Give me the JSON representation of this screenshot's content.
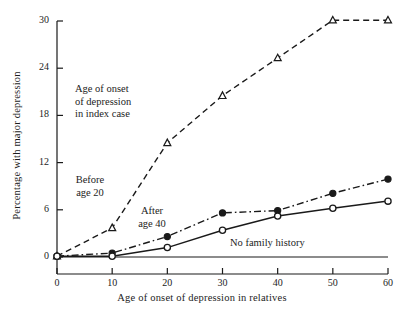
{
  "figure": {
    "background": "#ffffff",
    "ink": "#1a1a1a"
  },
  "chart_data": {
    "type": "line",
    "title": "",
    "xlabel": "Age of onset of depression in relatives",
    "ylabel": "Percentage with major depression",
    "xlim": [
      0,
      60
    ],
    "ylim": [
      0,
      30
    ],
    "xticks": [
      0,
      10,
      20,
      30,
      40,
      50,
      60
    ],
    "yticks": [
      0,
      6,
      12,
      18,
      24,
      30
    ],
    "xtick_labels": [
      "0",
      "10",
      "20",
      "30",
      "40",
      "50",
      "60"
    ],
    "ytick_labels": [
      "0",
      "6",
      "12",
      "18",
      "24",
      "30"
    ],
    "grid": false,
    "legend": "inline-annotations",
    "x": [
      0,
      10,
      20,
      30,
      40,
      50,
      60
    ],
    "series": [
      {
        "name": "Before age 20",
        "values": [
          0.1,
          3.7,
          14.5,
          20.5,
          25.3,
          30.1,
          30.1
        ],
        "linestyle": "dashed",
        "marker": "open-triangle",
        "color": "#1a1a1a"
      },
      {
        "name": "After age 40",
        "values": [
          0.1,
          0.5,
          2.6,
          5.6,
          5.9,
          8.1,
          9.9
        ],
        "linestyle": "dash-dot",
        "marker": "filled-circle",
        "color": "#1a1a1a"
      },
      {
        "name": "No family history",
        "values": [
          0.1,
          0.1,
          1.2,
          3.4,
          5.2,
          6.2,
          7.1
        ],
        "linestyle": "solid",
        "marker": "open-circle",
        "color": "#1a1a1a"
      }
    ],
    "annotations": [
      {
        "id": "index-case-note",
        "text": "Age of onset\nof depression\nin index case",
        "x_px": 75,
        "y_px": 83,
        "align": "left"
      },
      {
        "id": "before-age-20-label",
        "text": "Before\nage 20",
        "x_px": 90,
        "y_px": 174,
        "align": "center"
      },
      {
        "id": "after-age-40-label",
        "text": "After\nage 40",
        "x_px": 152,
        "y_px": 205,
        "align": "center"
      },
      {
        "id": "no-family-history-label",
        "text": "No family history",
        "x_px": 230,
        "y_px": 237,
        "align": "left"
      }
    ]
  }
}
